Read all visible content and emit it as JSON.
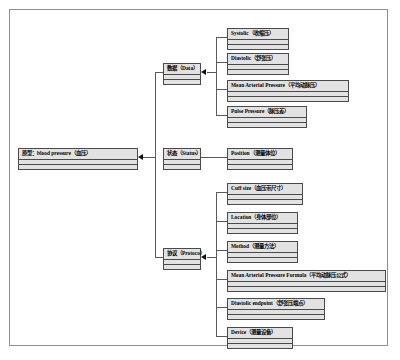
{
  "diagram": {
    "type": "tree",
    "orientation": "left-to-right",
    "root": {
      "id": "root",
      "label": "原型：blood pressure（血压）"
    },
    "branches": [
      {
        "id": "data",
        "label": "数据（Data）",
        "children": [
          {
            "id": "systolic",
            "label": "Systolic（收缩压）"
          },
          {
            "id": "diastolic",
            "label": "Diastolic（舒张压）"
          },
          {
            "id": "map",
            "label": "Mean Arterial Pressure（平均动脉压）"
          },
          {
            "id": "pulse-pressure",
            "label": "Pulse Pressure（脉压差）"
          }
        ]
      },
      {
        "id": "status",
        "label": "状态（Status）",
        "children": [
          {
            "id": "position",
            "label": "Position（测量体位）"
          }
        ]
      },
      {
        "id": "protocol",
        "label": "协议（Protoco）",
        "children": [
          {
            "id": "cuff-size",
            "label": "Cuff size（血压带尺寸）"
          },
          {
            "id": "location",
            "label": "Location（身体部位）"
          },
          {
            "id": "method",
            "label": "Method（测量方法）"
          },
          {
            "id": "map-formula",
            "label": "Mean Arterial Pressure Formula（平均动脉压公式）"
          },
          {
            "id": "diastolic-endpoint",
            "label": "Diastolic endpoint（舒张压端点）"
          },
          {
            "id": "device",
            "label": "Device（测量设备）"
          }
        ]
      }
    ],
    "colors": {
      "node_fill": "#e2e2e2",
      "node_border": "#4a4a4a",
      "connector": "#5a5a5a",
      "arrow": "#111111",
      "frame": "#8f8f8f",
      "background": "#ffffff"
    }
  }
}
